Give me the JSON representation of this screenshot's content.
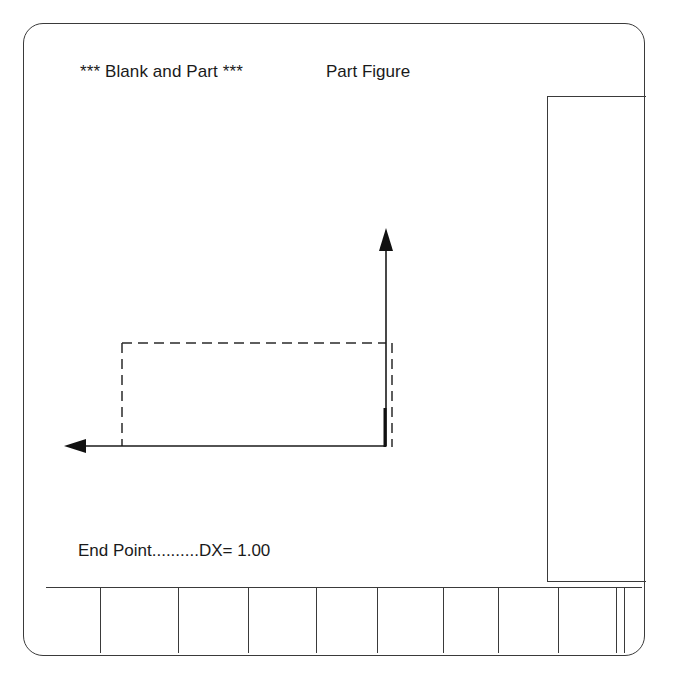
{
  "header": {
    "mode_title": "*** Blank and Part ***",
    "view_title": "Part Figure"
  },
  "status": {
    "prompt": "End Point..........DX= 1.00"
  },
  "drawing": {
    "axis_color": "#1a1a1a",
    "blank_outline_style": "dashed",
    "blank_rect": {
      "x1": 122,
      "y1": 343,
      "x2": 392,
      "y2": 447
    },
    "origin": {
      "x": 386,
      "y": 446
    },
    "x_axis_arrow": {
      "from_x": 386,
      "to_x": 64,
      "y": 446,
      "direction": "left"
    },
    "z_axis_arrow": {
      "from_y": 446,
      "to_y": 228,
      "x": 386,
      "direction": "up"
    },
    "part_segment": {
      "x": 385,
      "y1": 408,
      "y2": 447
    }
  },
  "softkeys": {
    "dividers_x": [
      100,
      178,
      248,
      316,
      377,
      443,
      498,
      558,
      616,
      624
    ],
    "labels": [
      "",
      "",
      "",
      "",
      "",
      "",
      "",
      "",
      "",
      ""
    ]
  }
}
